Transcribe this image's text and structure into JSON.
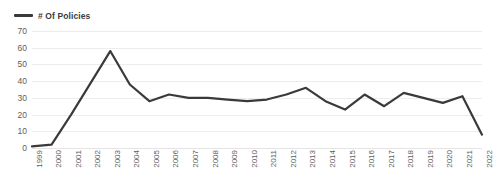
{
  "legend": {
    "position": "top-left",
    "entries": [
      {
        "label": "# Of Policies",
        "color": "#3a3a3a",
        "marker": "line-swatch"
      }
    ]
  },
  "chart_data": {
    "type": "line",
    "title": "",
    "subtitle": "",
    "xlabel": "",
    "ylabel": "",
    "categories": [
      "1999",
      "2000",
      "2001",
      "2002",
      "2003",
      "2004",
      "2005",
      "2006",
      "2007",
      "2008",
      "2009",
      "2010",
      "2011",
      "2012",
      "2013",
      "2014",
      "2015",
      "2016",
      "2017",
      "2018",
      "2019",
      "2020",
      "2021",
      "2022"
    ],
    "series": [
      {
        "name": "# Of Policies",
        "color": "#3a3a3a",
        "values": [
          1,
          2,
          20,
          39,
          58,
          38,
          28,
          32,
          30,
          30,
          29,
          28,
          29,
          32,
          36,
          28,
          23,
          32,
          25,
          33,
          30,
          27,
          31,
          8
        ]
      }
    ],
    "ylim": [
      0,
      70
    ],
    "ytick_values": [
      0,
      10,
      20,
      30,
      40,
      50,
      60,
      70
    ],
    "ytick_labels": [
      "0",
      "10",
      "20",
      "30",
      "40",
      "50",
      "60",
      "70"
    ],
    "grid": {
      "horizontal": true,
      "vertical": false,
      "color": "#ededed"
    },
    "legend_position": "top-left",
    "line_width": 2.2,
    "markers": false,
    "xtick_rotation": -90
  }
}
